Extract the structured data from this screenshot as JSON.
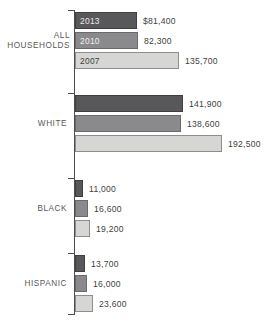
{
  "chart_data": {
    "type": "bar",
    "orientation": "horizontal",
    "title": "",
    "subtitle": "",
    "xlabel": "",
    "ylabel": "",
    "grid": false,
    "legend_position": "in-bar-labels",
    "xlim": [
      0,
      192500
    ],
    "categories": [
      "ALL HOUSEHOLDS",
      "WHITE",
      "BLACK",
      "HISPANIC"
    ],
    "series": [
      {
        "name": "2013",
        "color": "#58585a",
        "values": [
          81400,
          141900,
          11000,
          13700
        ]
      },
      {
        "name": "2010",
        "color": "#8a8a8c",
        "values": [
          82300,
          138600,
          16600,
          16000
        ]
      },
      {
        "name": "2007",
        "color": "#d6d6d4",
        "values": [
          135700,
          192500,
          19200,
          23600
        ]
      }
    ],
    "value_labels": [
      [
        "$81,400",
        "82,300",
        "135,700"
      ],
      [
        "141,900",
        "138,600",
        "192,500"
      ],
      [
        "11,000",
        "16,600",
        "19,200"
      ],
      [
        "13,700",
        "16,000",
        "23,600"
      ]
    ]
  },
  "groups": [
    {
      "label": "ALL HOUSEHOLDS",
      "label_lines": [
        "ALL",
        "HOUSEHOLDS"
      ],
      "bars": [
        {
          "year": "2013",
          "value_label": "$81,400",
          "value": 81400
        },
        {
          "year": "2010",
          "value_label": "82,300",
          "value": 82300
        },
        {
          "year": "2007",
          "value_label": "135,700",
          "value": 135700
        }
      ]
    },
    {
      "label": "WHITE",
      "label_lines": [
        "WHITE"
      ],
      "bars": [
        {
          "year": "2013",
          "value_label": "141,900",
          "value": 141900
        },
        {
          "year": "2010",
          "value_label": "138,600",
          "value": 138600
        },
        {
          "year": "2007",
          "value_label": "192,500",
          "value": 192500
        }
      ]
    },
    {
      "label": "BLACK",
      "label_lines": [
        "BLACK"
      ],
      "bars": [
        {
          "year": "2013",
          "value_label": "11,000",
          "value": 11000
        },
        {
          "year": "2010",
          "value_label": "16,600",
          "value": 16600
        },
        {
          "year": "2007",
          "value_label": "19,200",
          "value": 19200
        }
      ]
    },
    {
      "label": "HISPANIC",
      "label_lines": [
        "HISPANIC"
      ],
      "bars": [
        {
          "year": "2013",
          "value_label": "13,700",
          "value": 13700
        },
        {
          "year": "2010",
          "value_label": "16,000",
          "value": 16000
        },
        {
          "year": "2007",
          "value_label": "23,600",
          "value": 23600
        }
      ]
    }
  ],
  "colors": {
    "series_2013": "#58585a",
    "series_2010": "#8a8a8c",
    "series_2007": "#d6d6d4",
    "axis": "#4d4d4d",
    "text": "#3f3f41",
    "background": "#ffffff"
  }
}
